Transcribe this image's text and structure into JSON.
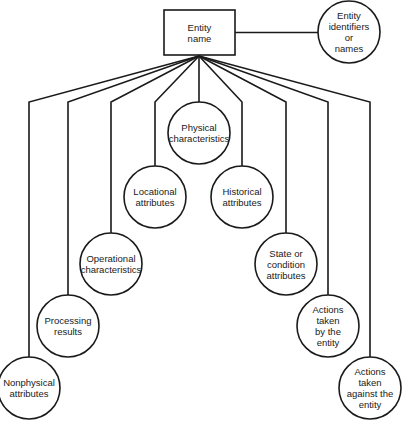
{
  "diagram": {
    "type": "entity attribute tree",
    "root": {
      "label_lines": [
        "Entity",
        "name"
      ],
      "shape": "rectangle",
      "x": 164,
      "y": 10,
      "w": 71,
      "h": 45
    },
    "side_node": {
      "label_lines": [
        "Entity",
        "identifiers",
        "or",
        "names"
      ],
      "shape": "circle",
      "cx": 349,
      "cy": 32,
      "r": 31
    },
    "children": [
      {
        "id": "nonphysical",
        "label_lines": [
          "Nonphysical",
          "attributes"
        ],
        "cx": 29,
        "cy": 388,
        "bend_x": 29
      },
      {
        "id": "processing",
        "label_lines": [
          "Processing",
          "results"
        ],
        "cx": 68,
        "cy": 326,
        "bend_x": 68
      },
      {
        "id": "operational",
        "label_lines": [
          "Operational",
          "characteristics"
        ],
        "cx": 111,
        "cy": 264,
        "bend_x": 111
      },
      {
        "id": "locational",
        "label_lines": [
          "Locational",
          "attributes"
        ],
        "cx": 155,
        "cy": 197,
        "bend_x": 155
      },
      {
        "id": "physical",
        "label_lines": [
          "Physical",
          "characteristics"
        ],
        "cx": 199,
        "cy": 133,
        "bend_x": 199
      },
      {
        "id": "historical",
        "label_lines": [
          "Historical",
          "attributes"
        ],
        "cx": 242,
        "cy": 197,
        "bend_x": 242
      },
      {
        "id": "state",
        "label_lines": [
          "State or",
          "condition",
          "attributes"
        ],
        "cx": 286,
        "cy": 264,
        "bend_x": 286
      },
      {
        "id": "actions-by",
        "label_lines": [
          "Actions",
          "taken",
          "by the",
          "entity"
        ],
        "cx": 328,
        "cy": 326,
        "bend_x": 328
      },
      {
        "id": "actions-against",
        "label_lines": [
          "Actions",
          "taken",
          "against the",
          "entity"
        ],
        "cx": 370,
        "cy": 388,
        "bend_x": 370
      }
    ],
    "fan_origin": {
      "x": 199,
      "y": 56
    },
    "bend_y": 102,
    "circle_radius": 31
  }
}
